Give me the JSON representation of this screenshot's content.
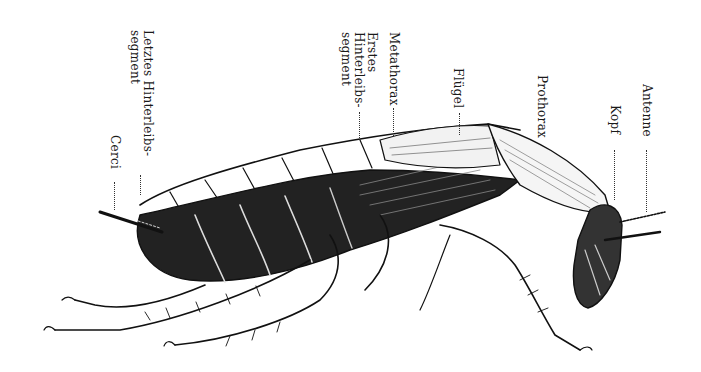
{
  "figure": {
    "style": "black-and-white anatomical engraving",
    "colors": {
      "ink": "#111111",
      "paper": "#ffffff"
    }
  },
  "labels": [
    {
      "id": "letztes-hinterleibssegment",
      "lines": [
        "Letztes Hinterleibs-",
        "segment"
      ]
    },
    {
      "id": "cerci",
      "lines": [
        "Cerci"
      ]
    },
    {
      "id": "metathorax",
      "lines": [
        "Metathorax"
      ]
    },
    {
      "id": "erstes-hinterleibssegment",
      "lines": [
        "Erstes",
        "Hinterleibs-",
        "segment"
      ]
    },
    {
      "id": "fluegel",
      "lines": [
        "Flügel"
      ]
    },
    {
      "id": "prothorax",
      "lines": [
        "Prothorax"
      ]
    },
    {
      "id": "antenne",
      "lines": [
        "Antenne"
      ]
    },
    {
      "id": "kopf",
      "lines": [
        "Kopf"
      ]
    }
  ]
}
